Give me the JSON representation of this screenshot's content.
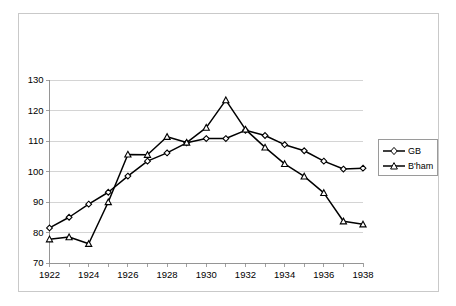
{
  "chart_data": {
    "type": "line",
    "title": "",
    "subtitle": "",
    "xlabel": "",
    "ylabel": "",
    "x": [
      1922,
      1923,
      1924,
      1925,
      1926,
      1927,
      1928,
      1929,
      1930,
      1931,
      1932,
      1933,
      1934,
      1935,
      1936,
      1937,
      1938
    ],
    "xtick_labels": [
      "1922",
      "1924",
      "1926",
      "1928",
      "1930",
      "1932",
      "1934",
      "1936",
      "1938"
    ],
    "xtick_values": [
      1922,
      1924,
      1926,
      1928,
      1930,
      1932,
      1934,
      1936,
      1938
    ],
    "ytick_labels": [
      "70",
      "80",
      "90",
      "100",
      "110",
      "120",
      "130"
    ],
    "ytick_values": [
      70,
      80,
      90,
      100,
      110,
      120,
      130
    ],
    "xlim": [
      1922,
      1938
    ],
    "ylim": [
      70,
      130
    ],
    "grid": true,
    "grid_axis": "y",
    "legend_position": "right",
    "series": [
      {
        "name": "GB",
        "marker": "diamond",
        "color": "#000000",
        "values": [
          81.5,
          85.0,
          89.3,
          93.2,
          98.5,
          103.4,
          106.1,
          109.4,
          110.8,
          110.8,
          113.5,
          111.8,
          108.8,
          106.8,
          103.4,
          100.8,
          101.1
        ]
      },
      {
        "name": "B'ham",
        "marker": "triangle",
        "color": "#000000",
        "values": [
          77.8,
          78.5,
          76.3,
          90.0,
          105.6,
          105.5,
          111.4,
          109.5,
          114.4,
          123.4,
          113.8,
          107.9,
          102.5,
          98.4,
          93.0,
          83.7,
          82.7
        ]
      }
    ]
  },
  "legend": {
    "items": [
      {
        "label": "GB",
        "marker": "diamond"
      },
      {
        "label": "B'ham",
        "marker": "triangle"
      }
    ]
  }
}
